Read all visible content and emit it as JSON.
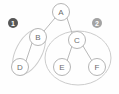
{
  "diagram": {
    "type": "tree-graph-with-clusters",
    "background_color": "#fefefe",
    "edge_color": "#b9b9b9",
    "node_stroke_color": "#b5b5b5",
    "node_fill_color": "#ffffff",
    "node_label_color": "#6d6d6d",
    "cluster_outline_color": "#cccccc",
    "nodes": [
      {
        "id": "A",
        "label": "A",
        "cx": 61,
        "cy": 12,
        "r": 8.5
      },
      {
        "id": "B",
        "label": "B",
        "cx": 38,
        "cy": 37,
        "r": 8.5
      },
      {
        "id": "C",
        "label": "C",
        "cx": 77,
        "cy": 40,
        "r": 8.5
      },
      {
        "id": "D",
        "label": "D",
        "cx": 20,
        "cy": 67,
        "r": 8.5
      },
      {
        "id": "E",
        "label": "E",
        "cx": 62,
        "cy": 67,
        "r": 8.5
      },
      {
        "id": "F",
        "label": "F",
        "cx": 97,
        "cy": 67,
        "r": 8.5
      }
    ],
    "edges": [
      {
        "from": "A",
        "to": "B",
        "x1": 55,
        "y1": 18,
        "x2": 44,
        "y2": 31
      },
      {
        "from": "A",
        "to": "C",
        "x1": 67,
        "y1": 18,
        "x2": 72,
        "y2": 33
      },
      {
        "from": "B",
        "to": "D",
        "x1": 32,
        "y1": 43,
        "x2": 26,
        "y2": 61
      },
      {
        "from": "C",
        "to": "E",
        "x1": 72,
        "y1": 46,
        "x2": 67,
        "y2": 61
      },
      {
        "from": "C",
        "to": "F",
        "x1": 83,
        "y1": 46,
        "x2": 92,
        "y2": 61
      }
    ],
    "clusters": [
      {
        "id": "cluster-1",
        "badge_label": "1",
        "badge_cx": 13,
        "badge_cy": 23,
        "badge_r": 5,
        "badge_fill": "#565656",
        "badge_text_color": "#ffffff",
        "members": [
          "B",
          "D"
        ],
        "shape": "ellipse",
        "cx": 29,
        "cy": 52,
        "rx": 13,
        "ry": 25,
        "rotation": 28
      },
      {
        "id": "cluster-2",
        "badge_label": "2",
        "badge_cx": 97,
        "badge_cy": 23,
        "badge_r": 5,
        "badge_fill": "#a3a3a3",
        "badge_text_color": "#ffffff",
        "members": [
          "C",
          "E",
          "F"
        ],
        "shape": "ellipse",
        "cx": 78,
        "cy": 58,
        "rx": 33,
        "ry": 27,
        "rotation": 0
      }
    ]
  }
}
